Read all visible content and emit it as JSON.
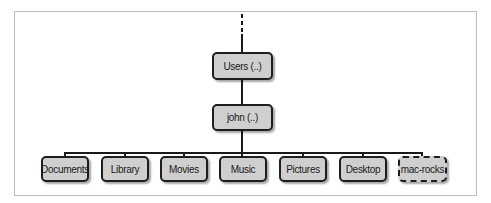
{
  "diagram": {
    "type": "directory-tree",
    "root_indicator": "dotted-line-continuation",
    "nodes": {
      "users": {
        "label": "Users (..)",
        "style": "solid"
      },
      "john": {
        "label": "john (..)",
        "style": "solid"
      },
      "children": [
        {
          "label": "Documents",
          "style": "solid"
        },
        {
          "label": "Library",
          "style": "solid"
        },
        {
          "label": "Movies",
          "style": "solid"
        },
        {
          "label": "Music",
          "style": "solid"
        },
        {
          "label": "Pictures",
          "style": "solid"
        },
        {
          "label": "Desktop",
          "style": "solid"
        },
        {
          "label": "mac-rocks",
          "style": "dashed"
        }
      ]
    },
    "edges": [
      [
        "Users (..)",
        "john (..)"
      ],
      [
        "john (..)",
        "Documents"
      ],
      [
        "john (..)",
        "Library"
      ],
      [
        "john (..)",
        "Movies"
      ],
      [
        "john (..)",
        "Music"
      ],
      [
        "john (..)",
        "Pictures"
      ],
      [
        "john (..)",
        "Desktop"
      ],
      [
        "john (..)",
        "mac-rocks"
      ]
    ],
    "colors": {
      "node_fill": "#cfcfcf",
      "node_border": "#1e1e1e",
      "line": "#1a1a1a",
      "frame": "#bdbdbd"
    }
  }
}
